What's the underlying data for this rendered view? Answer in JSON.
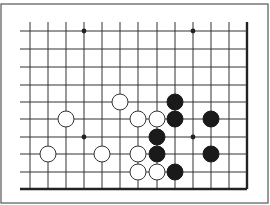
{
  "diagram": {
    "type": "go-board-fragment",
    "board_edges": [
      "right",
      "bottom"
    ],
    "columns_x": [
      30,
      48,
      66,
      84,
      102,
      120,
      138,
      157,
      175,
      193,
      211,
      229,
      247
    ],
    "rows_y": [
      31,
      49,
      67,
      85,
      102,
      119,
      137,
      154,
      172,
      189
    ],
    "line_start_x": 20,
    "line_start_y": 22,
    "star_points": [
      {
        "col": 3,
        "row": 0
      },
      {
        "col": 9,
        "row": 0
      },
      {
        "col": 3,
        "row": 6
      },
      {
        "col": 9,
        "row": 6
      }
    ],
    "stones": [
      {
        "color": "white",
        "col": 5,
        "row": 4
      },
      {
        "color": "black",
        "col": 8,
        "row": 4
      },
      {
        "color": "white",
        "col": 2,
        "row": 5
      },
      {
        "color": "white",
        "col": 6,
        "row": 5
      },
      {
        "color": "white",
        "col": 7,
        "row": 5
      },
      {
        "color": "black",
        "col": 8,
        "row": 5
      },
      {
        "color": "black",
        "col": 10,
        "row": 5
      },
      {
        "color": "black",
        "col": 7,
        "row": 6
      },
      {
        "color": "white",
        "col": 1,
        "row": 7
      },
      {
        "color": "white",
        "col": 4,
        "row": 7
      },
      {
        "color": "white",
        "col": 6,
        "row": 7
      },
      {
        "color": "black",
        "col": 7,
        "row": 7
      },
      {
        "color": "black",
        "col": 10,
        "row": 7
      },
      {
        "color": "white",
        "col": 6,
        "row": 8
      },
      {
        "color": "white",
        "col": 7,
        "row": 8
      },
      {
        "color": "black",
        "col": 8,
        "row": 8
      }
    ],
    "colors": {
      "background": "#ffffff",
      "line": "#333333",
      "edge": "#222222",
      "frame": "#555555",
      "black_stone": "#1a1a1a",
      "white_stone_fill": "#ffffff",
      "white_stone_stroke": "#333333"
    }
  }
}
